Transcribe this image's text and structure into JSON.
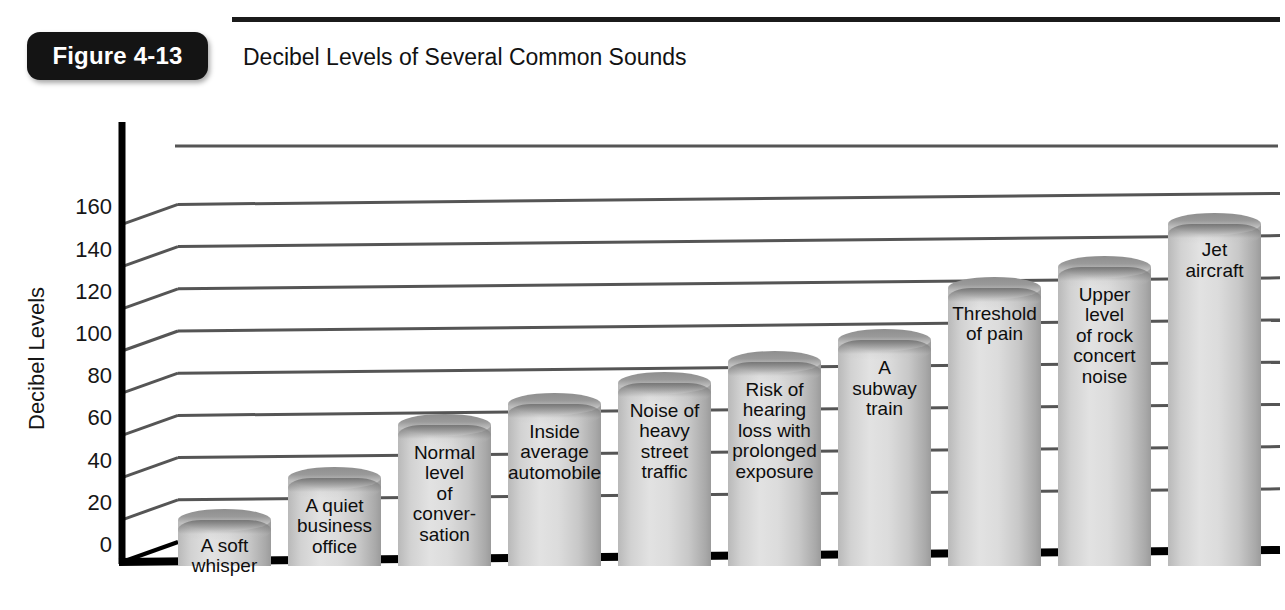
{
  "figure": {
    "badge_label": "Figure 4-13",
    "title": "Decibel Levels of Several Common Sounds"
  },
  "axis": {
    "y_title": "Decibel Levels",
    "y_ticks": [
      "160",
      "140",
      "120",
      "100",
      "80",
      "60",
      "40",
      "20",
      "0"
    ]
  },
  "chart_data": {
    "type": "bar",
    "title": "Decibel Levels of Several Common Sounds",
    "xlabel": "",
    "ylabel": "Decibel Levels",
    "ylim": [
      0,
      170
    ],
    "grid": true,
    "legend": "none",
    "style": "3d-cylinder-columns",
    "categories": [
      "A soft whisper",
      "A quiet business office",
      "Normal level of conver-sation",
      "Inside average automobile",
      "Noise of heavy street traffic",
      "Risk of hearing loss with prolonged exposure",
      "A subway train",
      "Threshold of pain",
      "Upper level of rock concert noise",
      "Jet aircraft"
    ],
    "values": [
      20,
      40,
      65,
      75,
      85,
      95,
      105,
      130,
      140,
      160
    ],
    "bar_labels": [
      "A soft\nwhisper",
      "A quiet\nbusiness\noffice",
      "Normal\nlevel\nof\nconver-\nsation",
      "Inside\naverage\nautomobile",
      "Noise of\nheavy\nstreet\ntraffic",
      "Risk of\nhearing\nloss with\nprolonged\nexposure",
      "A\nsubway\ntrain",
      "Threshold\nof pain",
      "Upper\nlevel\nof rock\nconcert\nnoise",
      "Jet\naircraft"
    ]
  },
  "colors": {
    "badge_bg": "#141414",
    "badge_text": "#ffffff",
    "rule": "#1b1b1b",
    "axis": "#000000",
    "gridline": "#555555",
    "bar_light": "#e2e2e2",
    "bar_dark": "#9b9b9b",
    "text": "#121212"
  }
}
